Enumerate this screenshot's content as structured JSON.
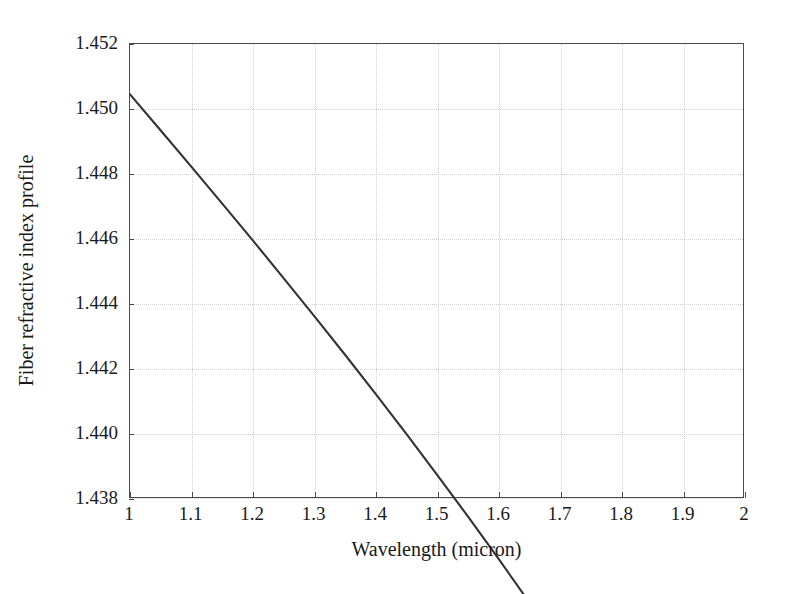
{
  "chart_data": {
    "type": "line",
    "title": "",
    "xlabel": "Wavelength (micron)",
    "ylabel": "Fiber refractive index profile",
    "xlim": [
      1,
      2
    ],
    "ylim": [
      1.438,
      1.452
    ],
    "grid": true,
    "legend": null,
    "xticks": [
      "1",
      "1.1",
      "1.2",
      "1.3",
      "1.4",
      "1.5",
      "1.6",
      "1.7",
      "1.8",
      "1.9",
      "2"
    ],
    "xtick_values": [
      1,
      1.1,
      1.2,
      1.3,
      1.4,
      1.5,
      1.6,
      1.7,
      1.8,
      1.9,
      2
    ],
    "yticks": [
      "1.438",
      "1.440",
      "1.442",
      "1.444",
      "1.446",
      "1.448",
      "1.450",
      "1.452"
    ],
    "ytick_values": [
      1.438,
      1.44,
      1.442,
      1.444,
      1.446,
      1.448,
      1.45,
      1.452
    ],
    "series": [
      {
        "name": "Fiber refractive index profile",
        "color": "#333333",
        "x": [
          1.0,
          1.05,
          1.1,
          1.15,
          1.2,
          1.25,
          1.3,
          1.35,
          1.4,
          1.45,
          1.5,
          1.55,
          1.6,
          1.65,
          1.7,
          1.75,
          1.8,
          1.85,
          1.9,
          1.95,
          2.0
        ],
        "values": [
          1.45045,
          1.44934,
          1.44822,
          1.44709,
          1.44595,
          1.44479,
          1.44362,
          1.44243,
          1.44122,
          1.43999,
          1.43873,
          1.43745,
          1.43614,
          1.4348,
          1.43343,
          1.43202,
          1.43058,
          1.4291,
          1.42758,
          1.42602,
          1.42442
        ]
      }
    ]
  },
  "axis": {
    "x_title": "Wavelength (micron)",
    "y_title": "Fiber refractive index profile"
  }
}
